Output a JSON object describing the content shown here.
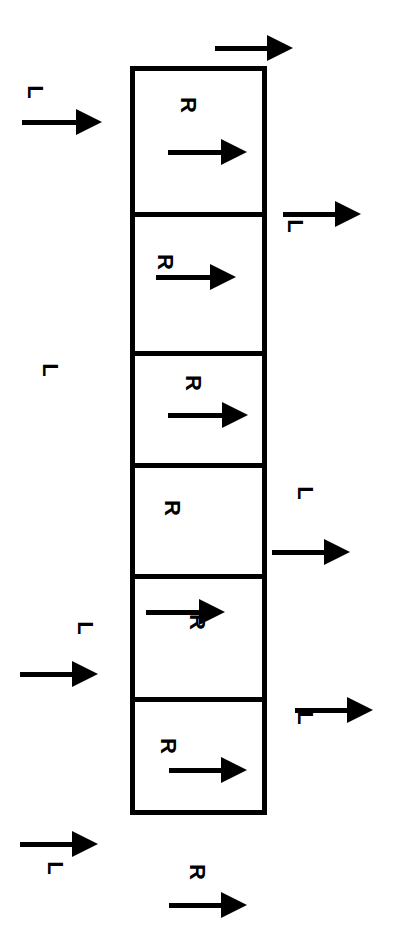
{
  "diagram": {
    "type": "segmented-column-with-flow-arrows",
    "colors": {
      "ink": "#000000",
      "background": "#ffffff"
    },
    "column": {
      "x": 130,
      "y": 66,
      "width": 137,
      "height": 749,
      "dividers_y": [
        214,
        353,
        465,
        576,
        699
      ],
      "cells": [
        {
          "label": "R",
          "label_pos": [
            188,
            105
          ],
          "arrow": {
            "x1": 168,
            "x2": 247,
            "y": 152
          }
        },
        {
          "label": "R",
          "label_pos": [
            165,
            262
          ],
          "arrow": {
            "x1": 156,
            "x2": 236,
            "y": 277
          }
        },
        {
          "label": "R",
          "label_pos": [
            193,
            383
          ],
          "arrow": {
            "x1": 168,
            "x2": 248,
            "y": 415
          }
        },
        {
          "label": "R",
          "label_pos": [
            172,
            508
          ],
          "arrow": null
        },
        {
          "label": "R",
          "label_pos": [
            197,
            622
          ],
          "arrow": {
            "x1": 146,
            "x2": 225,
            "y": 612
          }
        },
        {
          "label": "R",
          "label_pos": [
            168,
            746
          ],
          "arrow": {
            "x1": 169,
            "x2": 247,
            "y": 770
          }
        }
      ]
    },
    "outside_labels": [
      {
        "side": "left",
        "label": "L",
        "pos": [
          35,
          92
        ]
      },
      {
        "side": "left",
        "label": "L",
        "pos": [
          50,
          370
        ]
      },
      {
        "side": "left",
        "label": "L",
        "pos": [
          85,
          628
        ]
      },
      {
        "side": "left",
        "label": "L",
        "pos": [
          55,
          868
        ]
      },
      {
        "side": "right",
        "label": "L",
        "pos": [
          295,
          226
        ]
      },
      {
        "side": "right",
        "label": "L",
        "pos": [
          305,
          493
        ]
      },
      {
        "side": "right",
        "label": "L",
        "pos": [
          305,
          718
        ]
      },
      {
        "side": "bottom",
        "label": "R",
        "pos": [
          197,
          872
        ]
      }
    ],
    "outside_arrows": [
      {
        "side": "top",
        "x1": 215,
        "x2": 293,
        "y": 48
      },
      {
        "side": "left",
        "x1": 22,
        "x2": 102,
        "y": 122
      },
      {
        "side": "left",
        "x1": 20,
        "x2": 98,
        "y": 674
      },
      {
        "side": "left",
        "x1": 20,
        "x2": 98,
        "y": 844
      },
      {
        "side": "right",
        "x1": 283,
        "x2": 361,
        "y": 214
      },
      {
        "side": "right",
        "x1": 272,
        "x2": 350,
        "y": 552
      },
      {
        "side": "right",
        "x1": 295,
        "x2": 373,
        "y": 710
      },
      {
        "side": "bottom",
        "x1": 169,
        "x2": 247,
        "y": 905
      }
    ],
    "label_rotation_deg": 90
  }
}
